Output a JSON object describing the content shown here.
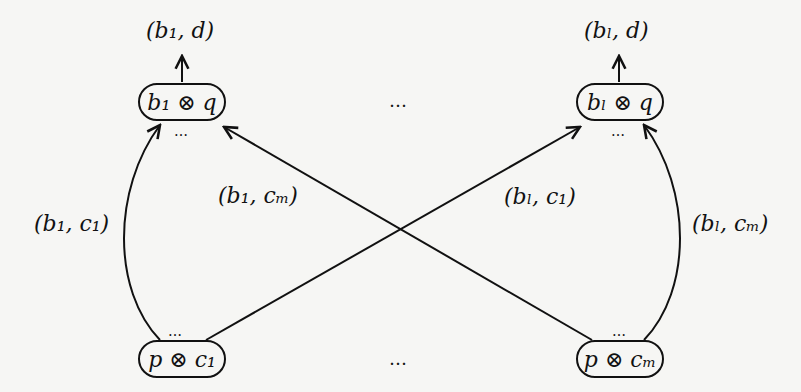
{
  "diagram": {
    "nodes": {
      "top_left": {
        "label": "b₁ ⊗ q",
        "dots_below": "…"
      },
      "top_right": {
        "label": "bₗ ⊗ q",
        "dots_below": "…"
      },
      "bottom_left": {
        "label": "p ⊗ c₁",
        "dots_above": "…"
      },
      "bottom_right": {
        "label": "p ⊗ cₘ",
        "dots_above": "…"
      }
    },
    "outputs": {
      "top_left": "(b₁, d)",
      "top_right": "(bₗ, d)"
    },
    "edges": [
      {
        "from": "bottom_left",
        "to": "top_left",
        "label": "(b₁, c₁)"
      },
      {
        "from": "bottom_right",
        "to": "top_left",
        "label": "(b₁, cₘ)"
      },
      {
        "from": "bottom_left",
        "to": "top_right",
        "label": "(bₗ, c₁)"
      },
      {
        "from": "bottom_right",
        "to": "top_right",
        "label": "(bₗ, cₘ)"
      }
    ],
    "row_ellipsis_top": "…",
    "row_ellipsis_bottom": "…",
    "colors": {
      "stroke": "#111111",
      "background": "#f6f6f4"
    }
  }
}
